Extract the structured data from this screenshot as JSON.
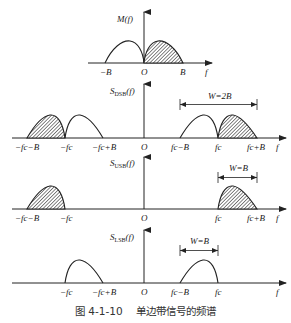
{
  "caption": {
    "figure_number": "图 4-1-10",
    "title": "单边带信号的频谱"
  },
  "panels": [
    {
      "id": "baseband",
      "y_label": "M(f)",
      "x_ticks": [
        "−B",
        "O",
        "B",
        "f"
      ],
      "description": "Baseband spectrum: unshaded lobe on negative side, shaded lobe on positive side"
    },
    {
      "id": "dsb",
      "y_label": "S_DSB(f)",
      "y_label_main": "S",
      "y_label_sub": "DSB",
      "y_label_tail": "(f)",
      "x_ticks": [
        "−fc−B",
        "−fc",
        "−fc+B",
        "O",
        "fc−B",
        "fc",
        "fc+B",
        "f"
      ],
      "bandwidth_label": "W=2B"
    },
    {
      "id": "usb",
      "y_label": "S_USB(f)",
      "y_label_main": "S",
      "y_label_sub": "USB",
      "y_label_tail": "(f)",
      "x_ticks": [
        "−fc−B",
        "−fc",
        "O",
        "fc",
        "fc+B",
        "f"
      ],
      "bandwidth_label": "W=B"
    },
    {
      "id": "lsb",
      "y_label": "S_LSB(f)",
      "y_label_main": "S",
      "y_label_sub": "LSB",
      "y_label_tail": "(f)",
      "x_ticks": [
        "−fc",
        "−fc+B",
        "O",
        "fc−B",
        "fc",
        "f"
      ],
      "bandwidth_label": "W=B"
    }
  ],
  "labels": {
    "m_f": "M(f)",
    "neg_B": "−B",
    "origin": "O",
    "pos_B": "B",
    "f": "f",
    "neg_fc_minus_B": "−fc−B",
    "neg_fc": "−fc",
    "neg_fc_plus_B": "−fc+B",
    "fc_minus_B": "fc−B",
    "fc": "fc",
    "fc_plus_B": "fc+B",
    "w_2b": "W=2B",
    "w_b": "W=B",
    "S": "S",
    "sub_dsb": "DSB",
    "sub_usb": "USB",
    "sub_lsb": "LSB",
    "paren_f": "(f)"
  },
  "colors": {
    "line": "#222222",
    "hatch": "#555555",
    "background": "#ffffff"
  }
}
